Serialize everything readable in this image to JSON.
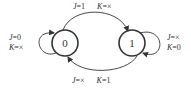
{
  "states": [
    {
      "id": "state-0",
      "label": "0"
    },
    {
      "id": "state-1",
      "label": "1"
    }
  ],
  "transitions": {
    "top": {
      "from": "0",
      "to": "1",
      "j_var": "J",
      "j_val": "=1",
      "k_var": "K",
      "k_val": "=×"
    },
    "bottom": {
      "from": "1",
      "to": "0",
      "j_var": "J",
      "j_val": "=×",
      "k_var": "K",
      "k_val": "=1"
    },
    "self_0": {
      "j_var": "J",
      "j_val": "=0",
      "k_var": "K",
      "k_val": "=×"
    },
    "self_1": {
      "j_var": "J",
      "j_val": "=×",
      "k_var": "K",
      "k_val": "=0"
    }
  },
  "colors": {
    "stroke": "#333333",
    "background": "#ffffff"
  }
}
